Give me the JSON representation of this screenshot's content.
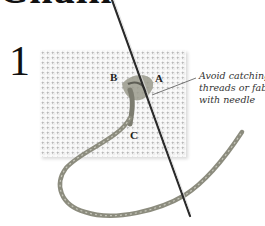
{
  "header": {
    "title": "Chain"
  },
  "step": {
    "number": "1"
  },
  "diagram": {
    "points": {
      "a": "A",
      "b": "B",
      "c": "C"
    },
    "annotation": {
      "lines": [
        "Avoid catching",
        "threads or fabric",
        "with needle"
      ]
    },
    "colors": {
      "fabric": "#eeeeee",
      "thread": "#8a8a7a",
      "needle": "#222222"
    }
  }
}
